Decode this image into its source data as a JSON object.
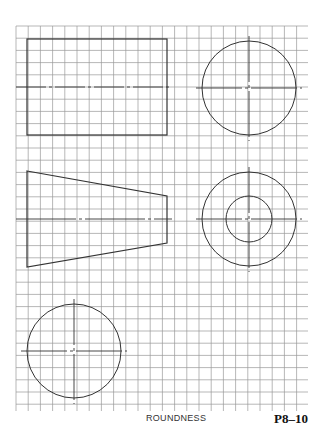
{
  "caption": "ROUNDNESS",
  "figure_number": "P8–10",
  "grid": {
    "x0": 16,
    "y0": 26,
    "x1": 308,
    "y1": 411,
    "spacing": 12.2,
    "color": "#9a9a9a"
  },
  "shapes": {
    "rectangle": {
      "x": 27,
      "y": 39,
      "w": 140,
      "h": 96,
      "centerline_y": 87
    },
    "circle_top_right": {
      "cx": 249,
      "cy": 88,
      "r": 47
    },
    "trapezoid": {
      "points": "27,171 167,196 167,243 27,267",
      "centerline_y": 219
    },
    "concentric_circles": {
      "cx": 249,
      "cy": 219,
      "r_outer": 47,
      "r_inner": 23
    },
    "circle_bottom_left": {
      "cx": 74,
      "cy": 351,
      "r": 47
    }
  },
  "line_color": "#333333"
}
